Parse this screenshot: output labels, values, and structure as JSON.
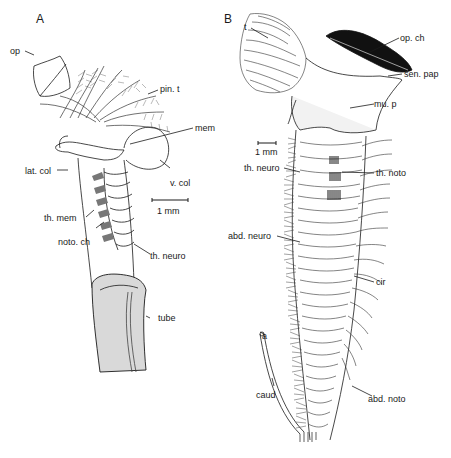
{
  "figure": {
    "panels": [
      {
        "id": "A",
        "letter": "A",
        "scale_bar": "1 mm",
        "labels": {
          "op": "op",
          "pin_t": "pin. t",
          "mem": "mem",
          "lat_col": "lat. col",
          "v_col": "v. col",
          "th_mem": "th. mem",
          "noto_ch": "noto. ch",
          "th_neuro": "th. neuro",
          "tube": "tube"
        }
      },
      {
        "id": "B",
        "letter": "B",
        "scale_bar": "1 mm",
        "labels": {
          "t": "t",
          "op_ch": "op. ch",
          "sen_pap": "sen. pap",
          "mu_p": "mu. p",
          "th_neuro": "th. neuro",
          "th_noto": "th. noto",
          "abd_neuro": "abd. neuro",
          "cir": "cir",
          "a": "a",
          "caud": "caud",
          "abd_noto": "abd. noto"
        }
      }
    ],
    "colors": {
      "ink": "#1a1a1a",
      "tube_fill": "#d9d9d9",
      "background": "#ffffff"
    }
  }
}
